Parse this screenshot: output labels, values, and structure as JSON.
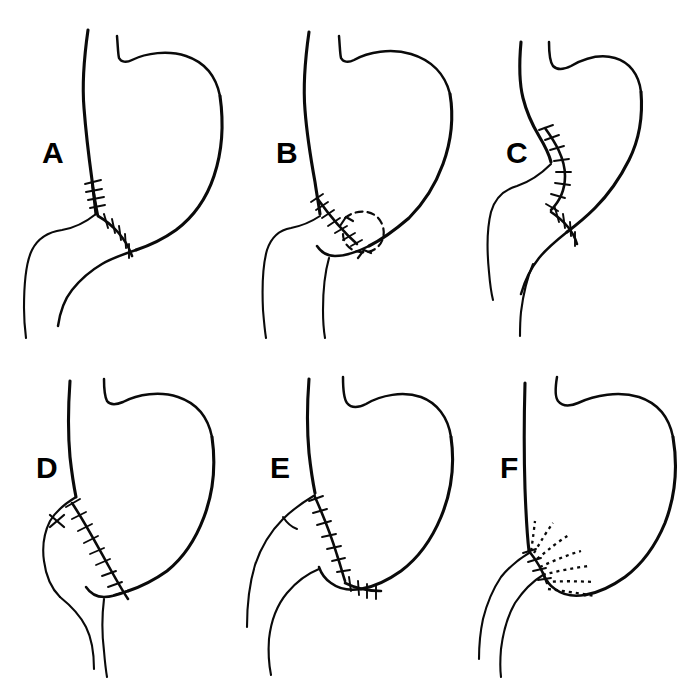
{
  "figure": {
    "kind": "line-art-medical-illustration",
    "background_color": "#ffffff",
    "ink_color": "#0a0a0a",
    "panel_count": 6,
    "grid": "3 columns x 2 rows",
    "width": 692,
    "height": 678
  },
  "panels": [
    {
      "label": "A",
      "row": 1,
      "column": 1,
      "annotation_kind": "suture-line",
      "description": "stomach with esophagus joined by a continuous sutured anastomosis running down then curving right",
      "features": [
        "vertical suture segment",
        "curved lower suture segment"
      ]
    },
    {
      "label": "B",
      "row": 1,
      "column": 2,
      "annotation_kind": "suture-line-with-dashed-arrow-loop",
      "description": "stomach with an oblique sutured closure at the lower left and a dashed oval arrow indicating rotation of the segment",
      "features": [
        "oblique suture line",
        "dashed oval loop",
        "arrowhead pointing up-left"
      ]
    },
    {
      "label": "C",
      "row": 1,
      "column": 3,
      "annotation_kind": "suture-line",
      "description": "narrowed tubular stomach with a long arcing sutured seam along the lesser curve",
      "features": [
        "arcing upper suture",
        "short lower suture"
      ]
    },
    {
      "label": "D",
      "row": 2,
      "column": 1,
      "annotation_kind": "suture-line-with-knot",
      "description": "stomach with a long diagonal sutured seam and a single cross-stitch knot at its upper end",
      "features": [
        "long diagonal suture line",
        "X cross-stitch knot"
      ]
    },
    {
      "label": "E",
      "row": 2,
      "column": 2,
      "annotation_kind": "suture-line",
      "description": "stomach with a loop of bowel anastomosed, vertical suture seam plus short horizontal suture run",
      "features": [
        "vertical curved suture",
        "short horizontal suture run",
        "bowel loop"
      ]
    },
    {
      "label": "F",
      "row": 2,
      "column": 3,
      "annotation_kind": "radiating-dotted-rays",
      "description": "stomach with a dotted sutured junction from which a fan of dotted tension lines radiates into the gastric wall",
      "features": [
        "dotted anastomotic arc",
        "fan of seven dotted radiating rays"
      ]
    }
  ]
}
